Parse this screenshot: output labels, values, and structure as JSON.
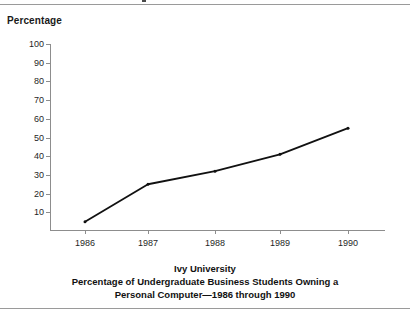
{
  "axis_title": "Percentage",
  "caption": {
    "line1": "Ivy University",
    "line2": "Percentage of Undergraduate Business Students Owning a",
    "line3": "Personal Computer—1986 through 1990"
  },
  "chart_data": {
    "type": "line",
    "title": "Ivy University Percentage of Undergraduate Business Students Owning a Personal Computer—1986 through 1990",
    "xlabel": "",
    "ylabel": "Percentage",
    "categories": [
      "1986",
      "1987",
      "1988",
      "1989",
      "1990"
    ],
    "values": [
      5,
      25,
      32,
      41,
      55
    ],
    "series": [
      {
        "name": "Percentage owning a personal computer",
        "values": [
          5,
          25,
          32,
          41,
          55
        ]
      }
    ],
    "ylim": [
      0,
      100
    ],
    "ytick_labels": [
      "10",
      "20",
      "30",
      "40",
      "50",
      "60",
      "70",
      "80",
      "90",
      "100"
    ],
    "ytick_values": [
      10,
      20,
      30,
      40,
      50,
      60,
      70,
      80,
      90,
      100
    ],
    "grid": false,
    "legend": "none",
    "line_color": "#111111",
    "marker": "dot",
    "axis_color": "#8d8d8d"
  }
}
